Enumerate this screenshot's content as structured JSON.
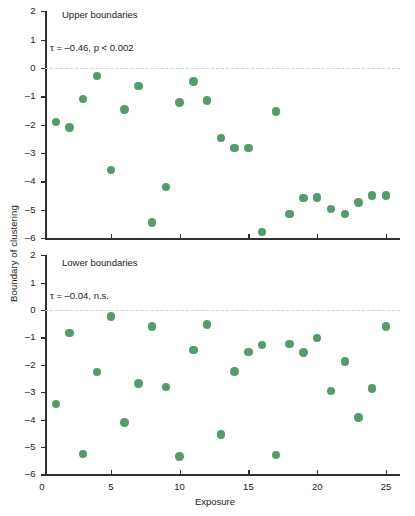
{
  "figure": {
    "ylabel": "Boundary of clustering",
    "xlabel": "Exposure"
  },
  "chart_data": [
    {
      "type": "scatter",
      "title": "Upper boundaries",
      "annotation": "τ = –0.46, p < 0.002",
      "tau": -0.46,
      "p_text": "p < 0.002",
      "xlabel": "Exposure",
      "ylabel": "Boundary of clustering",
      "xlim": [
        0,
        26
      ],
      "ylim": [
        -6,
        2
      ],
      "xticks": [
        0,
        5,
        10,
        15,
        20,
        25
      ],
      "yticks": [
        2,
        1,
        0,
        -1,
        -2,
        -3,
        -4,
        -5,
        -6
      ],
      "grid": false,
      "legend": "none",
      "marker_color": "#559c6c",
      "reference_line": {
        "y": 0,
        "style": "dashed",
        "color": "#bcd8e0"
      },
      "x": [
        1,
        2,
        3,
        4,
        5,
        6,
        7,
        8,
        9,
        10,
        11,
        12,
        13,
        14,
        15,
        16,
        17,
        18,
        19,
        20,
        21,
        22,
        23,
        24,
        25
      ],
      "y": [
        -1.9,
        -2.1,
        -1.1,
        -0.28,
        -3.6,
        -1.47,
        -0.63,
        -5.45,
        -4.2,
        -1.22,
        -0.47,
        -1.15,
        -2.47,
        -2.82,
        -2.82,
        -5.78,
        -1.53,
        -5.15,
        -4.58,
        -4.57,
        -4.97,
        -5.15,
        -4.75,
        -4.5,
        -4.5
      ]
    },
    {
      "type": "scatter",
      "title": "Lower boundaries",
      "annotation": "τ = –0.04, n.s.",
      "tau": -0.04,
      "p_text": "n.s.",
      "xlabel": "Exposure",
      "ylabel": "Boundary of clustering",
      "xlim": [
        0,
        26
      ],
      "ylim": [
        -6,
        2
      ],
      "xticks": [
        0,
        5,
        10,
        15,
        20,
        25
      ],
      "yticks": [
        2,
        1,
        0,
        -1,
        -2,
        -3,
        -4,
        -5,
        -6
      ],
      "grid": false,
      "legend": "none",
      "marker_color": "#559c6c",
      "reference_line": {
        "y": 0,
        "style": "dashed",
        "color": "#bcd8e0"
      },
      "x": [
        1,
        2,
        3,
        4,
        5,
        6,
        7,
        8,
        9,
        10,
        11,
        12,
        13,
        14,
        15,
        16,
        17,
        18,
        19,
        20,
        21,
        22,
        23,
        24,
        25
      ],
      "y": [
        -3.42,
        -0.85,
        -5.25,
        -2.27,
        -0.24,
        -4.1,
        -2.68,
        -0.6,
        -2.82,
        -5.35,
        -1.47,
        -0.53,
        -4.55,
        -2.25,
        -1.53,
        -1.27,
        -5.3,
        -1.25,
        -1.55,
        -1.02,
        -2.95,
        -1.88,
        -3.93,
        -2.87,
        -0.6
      ]
    }
  ]
}
